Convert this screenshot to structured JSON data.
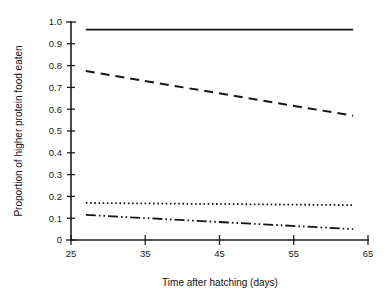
{
  "chart_data": {
    "type": "line",
    "title": "",
    "xlabel": "Time after hatching (days)",
    "ylabel": "Proportion of higher protein food eaten",
    "xlim": [
      25,
      65
    ],
    "ylim": [
      0,
      1.0
    ],
    "grid": false,
    "legend": "none",
    "xticks": [
      25,
      35,
      45,
      55,
      65
    ],
    "xtick_labels": [
      "25",
      "35",
      "45",
      "55",
      "65"
    ],
    "yticks": [
      0,
      0.1,
      0.2,
      0.3,
      0.4,
      0.5,
      0.6,
      0.7,
      0.8,
      0.9,
      1.0
    ],
    "ytick_labels": [
      "0",
      "0.1",
      "0.2",
      "0.3",
      "0.4",
      "0.5",
      "0.6",
      "0.7",
      "0.8",
      "0.9",
      "1.0"
    ],
    "x": [
      27,
      63
    ],
    "series": [
      {
        "name": "series-1",
        "style": "solid",
        "color": "#161616",
        "values": [
          0.965,
          0.965
        ]
      },
      {
        "name": "series-2",
        "style": "dashed",
        "color": "#161616",
        "values": [
          0.775,
          0.57
        ]
      },
      {
        "name": "series-3",
        "style": "dotted",
        "color": "#161616",
        "values": [
          0.17,
          0.16
        ]
      },
      {
        "name": "series-4",
        "style": "dash-dot-dot",
        "color": "#161616",
        "values": [
          0.115,
          0.05
        ]
      }
    ]
  },
  "figure": {
    "background_color": "#ffffff",
    "axis_color": "#1d1d1d"
  }
}
